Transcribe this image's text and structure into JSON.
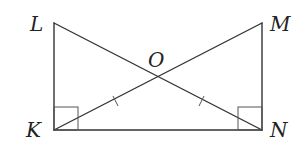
{
  "diagram": {
    "type": "geometry",
    "points": {
      "L": {
        "label": "L",
        "x": 54,
        "y": 23
      },
      "M": {
        "label": "M",
        "x": 262,
        "y": 23
      },
      "K": {
        "label": "K",
        "x": 54,
        "y": 130
      },
      "N": {
        "label": "N",
        "x": 262,
        "y": 130
      },
      "O": {
        "label": "O",
        "x": 158,
        "y": 76
      }
    },
    "segments": [
      {
        "from": "L",
        "to": "K"
      },
      {
        "from": "K",
        "to": "N"
      },
      {
        "from": "M",
        "to": "N"
      },
      {
        "from": "L",
        "to": "N"
      },
      {
        "from": "K",
        "to": "M"
      }
    ],
    "right_angles": [
      "K",
      "N"
    ],
    "congruence_marks": [
      {
        "segment": "KO",
        "ticks": 1
      },
      {
        "segment": "ON",
        "ticks": 1
      }
    ],
    "colors": {
      "line": "#333333",
      "background": "#ffffff"
    }
  }
}
